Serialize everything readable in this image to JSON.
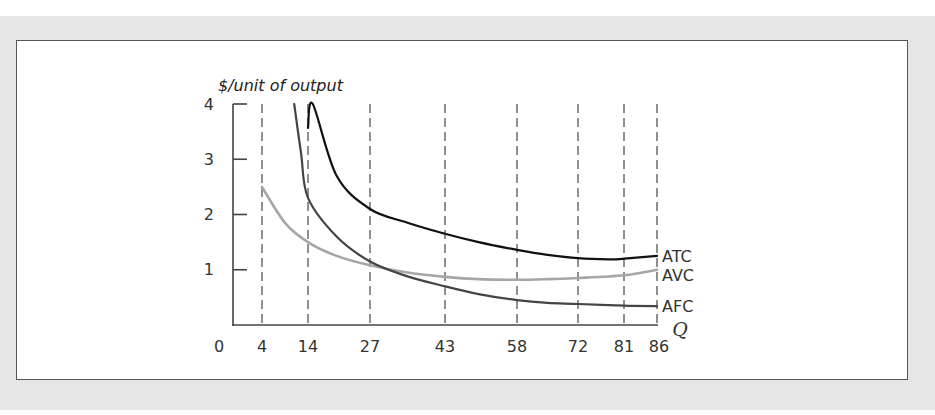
{
  "chart_data": {
    "type": "line",
    "title": "",
    "xlabel": "Q",
    "ylabel": "$/unit of output",
    "ylim": [
      0,
      4
    ],
    "xlim": [
      0,
      86
    ],
    "y_ticks": [
      "1",
      "2",
      "3",
      "4"
    ],
    "x_ticks": [
      "0",
      "4",
      "14",
      "27",
      "43",
      "58",
      "72",
      "81",
      "86"
    ],
    "dashed_reference_lines_at_q": [
      4,
      14,
      27,
      43,
      58,
      72,
      81,
      86
    ],
    "grid": false,
    "legend_position": "inline-right",
    "series": [
      {
        "name": "ATC",
        "color": "#111111",
        "points": [
          [
            15,
            4.0
          ],
          [
            14,
            3.57
          ],
          [
            20,
            2.7
          ],
          [
            27,
            2.1
          ],
          [
            35,
            1.85
          ],
          [
            43,
            1.65
          ],
          [
            50,
            1.5
          ],
          [
            58,
            1.36
          ],
          [
            65,
            1.27
          ],
          [
            72,
            1.21
          ],
          [
            78,
            1.19
          ],
          [
            81,
            1.2
          ],
          [
            86,
            1.25
          ]
        ]
      },
      {
        "name": "AVC",
        "color": "#a6a6a6",
        "points": [
          [
            4,
            2.5
          ],
          [
            9,
            1.85
          ],
          [
            14,
            1.5
          ],
          [
            20,
            1.25
          ],
          [
            27,
            1.08
          ],
          [
            35,
            0.95
          ],
          [
            43,
            0.87
          ],
          [
            50,
            0.83
          ],
          [
            58,
            0.82
          ],
          [
            65,
            0.83
          ],
          [
            72,
            0.85
          ],
          [
            81,
            0.9
          ],
          [
            86,
            1.0
          ]
        ]
      },
      {
        "name": "AFC",
        "color": "#444444",
        "points": [
          [
            11,
            4.0
          ],
          [
            12.5,
            3.1
          ],
          [
            14,
            2.3
          ],
          [
            20,
            1.6
          ],
          [
            27,
            1.15
          ],
          [
            35,
            0.88
          ],
          [
            43,
            0.7
          ],
          [
            50,
            0.56
          ],
          [
            58,
            0.45
          ],
          [
            65,
            0.4
          ],
          [
            72,
            0.38
          ],
          [
            81,
            0.35
          ],
          [
            86,
            0.34
          ]
        ]
      }
    ]
  },
  "axis": {
    "ylabel": "$/unit of output",
    "qlabel": "Q",
    "y_tick_labels": [
      "1",
      "2",
      "3",
      "4"
    ],
    "x_tick_labels": [
      "0",
      "4",
      "14",
      "27",
      "43",
      "58",
      "72",
      "81",
      "86"
    ]
  },
  "legend": {
    "atc": "ATC",
    "avc": "AVC",
    "afc": "AFC"
  }
}
